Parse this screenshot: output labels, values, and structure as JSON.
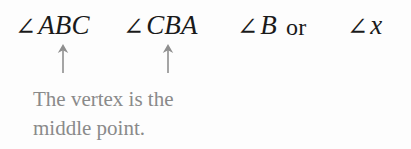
{
  "figure": {
    "background_color": "#fdfdfd",
    "text_color": "#1a1a1a",
    "annotation_color": "#8a8a8a"
  },
  "notations": {
    "angle_symbol": "∠",
    "items": [
      {
        "id": "abc",
        "symbol": "∠",
        "label": "ABC",
        "style": "italic"
      },
      {
        "id": "cba",
        "symbol": "∠",
        "label": "CBA",
        "style": "italic"
      },
      {
        "id": "b",
        "symbol": "∠",
        "label": "B",
        "style": "italic"
      },
      {
        "id": "x",
        "symbol": "∠",
        "label": "x",
        "style": "italic"
      }
    ],
    "conjunction": "or"
  },
  "pointers": [
    {
      "id": "arrow-1",
      "glyph": "up-arrow",
      "points_to": "B in ∠ABC"
    },
    {
      "id": "arrow-2",
      "glyph": "up-arrow",
      "points_to": "B in ∠CBA"
    }
  ],
  "caption": {
    "line1": "The vertex is the",
    "line2": "middle point."
  }
}
